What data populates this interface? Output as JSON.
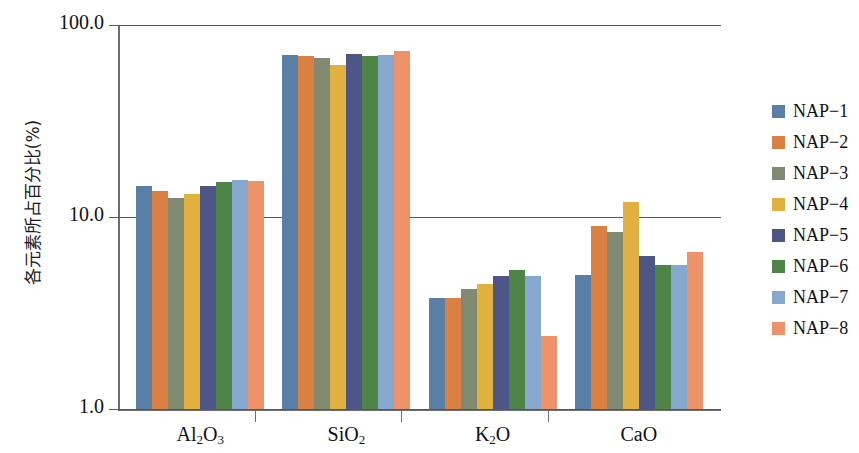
{
  "chart_data": {
    "type": "bar",
    "title": "",
    "xlabel": "",
    "ylabel": "各元素所占百分比(%)",
    "yscale": "log",
    "ylim": [
      1.0,
      100.0
    ],
    "ytick_labels": [
      "100.0",
      "10.0",
      "1.0"
    ],
    "ytick_values": [
      100.0,
      10.0,
      1.0
    ],
    "grid": true,
    "legend_position": "right",
    "categories": [
      "Al2O3",
      "SiO2",
      "K2O",
      "CaO"
    ],
    "category_labels_display": [
      "Al₂O₃",
      "SiO₂",
      "K₂O",
      "CaO"
    ],
    "series": [
      {
        "name": "NAP-1",
        "color": "#5a7fa6",
        "values": [
          14.5,
          70.0,
          3.8,
          5.0
        ]
      },
      {
        "name": "NAP-2",
        "color": "#da8043",
        "values": [
          13.6,
          69.0,
          3.8,
          9.0
        ]
      },
      {
        "name": "NAP-3",
        "color": "#7f8a70",
        "values": [
          12.5,
          67.0,
          4.2,
          8.4
        ]
      },
      {
        "name": "NAP-4",
        "color": "#e0b040",
        "values": [
          13.1,
          62.0,
          4.5,
          12.0
        ]
      },
      {
        "name": "NAP-5",
        "color": "#4d5687",
        "values": [
          14.5,
          71.0,
          4.9,
          6.3
        ]
      },
      {
        "name": "NAP-6",
        "color": "#4f8449",
        "values": [
          15.3,
          69.0,
          5.3,
          5.6
        ]
      },
      {
        "name": "NAP-7",
        "color": "#86a8ce",
        "values": [
          15.5,
          70.0,
          4.9,
          5.6
        ]
      },
      {
        "name": "NAP-8",
        "color": "#ed9269",
        "values": [
          15.4,
          73.0,
          2.4,
          6.6
        ]
      }
    ]
  },
  "legend": {
    "items": [
      {
        "label": "NAP−1",
        "color": "#5a7fa6"
      },
      {
        "label": "NAP−2",
        "color": "#da8043"
      },
      {
        "label": "NAP−3",
        "color": "#7f8a70"
      },
      {
        "label": "NAP−4",
        "color": "#e0b040"
      },
      {
        "label": "NAP−5",
        "color": "#4d5687"
      },
      {
        "label": "NAP−6",
        "color": "#4f8449"
      },
      {
        "label": "NAP−7",
        "color": "#86a8ce"
      },
      {
        "label": "NAP−8",
        "color": "#ed9269"
      }
    ]
  },
  "axes": {
    "y_title": "各元素所占百分比(%)",
    "y_ticks": [
      "100.0",
      "10.0",
      "1.0"
    ],
    "x_categories": [
      "Al₂O₃",
      "SiO₂",
      "K₂O",
      "CaO"
    ]
  }
}
